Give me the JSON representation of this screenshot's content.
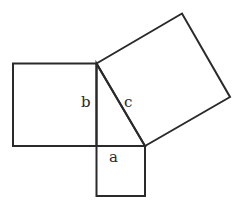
{
  "diagram": {
    "stroke_color": "#2a2a2a",
    "background": "#ffffff",
    "labels": {
      "a": "a",
      "b": "b",
      "c": "c"
    },
    "shapes": {
      "triangle": {
        "points": [
          [
            96.5,
            63.5
          ],
          [
            96.5,
            146
          ],
          [
            145,
            146
          ]
        ]
      },
      "square_a": {
        "points": [
          [
            96.5,
            146
          ],
          [
            145,
            146
          ],
          [
            145,
            196
          ],
          [
            96.5,
            196
          ]
        ]
      },
      "square_b": {
        "points": [
          [
            13,
            63.5
          ],
          [
            96.5,
            63.5
          ],
          [
            96.5,
            146
          ],
          [
            13,
            146
          ]
        ]
      },
      "square_c": {
        "points": [
          [
            96.5,
            63.5
          ],
          [
            182,
            13.5
          ],
          [
            230,
            97
          ],
          [
            145,
            146
          ]
        ]
      }
    }
  }
}
